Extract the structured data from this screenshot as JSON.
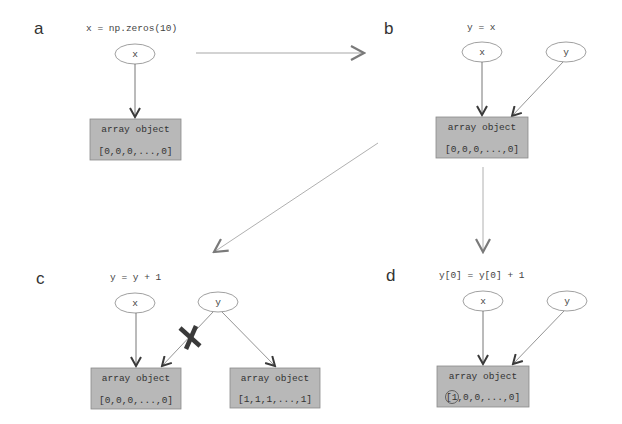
{
  "figure": {
    "colors": {
      "background": "#ffffff",
      "box_fill": "#b8b8b8",
      "box_stroke": "#8a8a8a",
      "edge": "#555555",
      "arrow_light": "#aaaaaa",
      "transition_arrow": "#9a9a9a",
      "x_mark": "#3a3a3a",
      "text": "#444444"
    },
    "panels": [
      {
        "label": "a",
        "code": "x = np.zeros(10)",
        "variables": [
          "x"
        ],
        "arrays": [
          {
            "title": "array object",
            "values": "[0,0,0,...,0]"
          }
        ]
      },
      {
        "label": "b",
        "code": "y = x",
        "variables": [
          "x",
          "y"
        ],
        "arrays": [
          {
            "title": "array object",
            "values": "[0,0,0,...,0]"
          }
        ]
      },
      {
        "label": "c",
        "code": "y = y + 1",
        "variables": [
          "x",
          "y"
        ],
        "arrays": [
          {
            "title": "array object",
            "values": "[0,0,0,...,0]"
          },
          {
            "title": "array object",
            "values": "[1,1,1,...,1]"
          }
        ],
        "broken_reference_mark": "X"
      },
      {
        "label": "d",
        "code": "y[0] = y[0] + 1",
        "variables": [
          "x",
          "y"
        ],
        "arrays": [
          {
            "title": "array object",
            "values_first": "1",
            "values_rest": ",0,0,...,0]",
            "values_open": "["
          }
        ],
        "highlighted_element": "1"
      }
    ]
  }
}
